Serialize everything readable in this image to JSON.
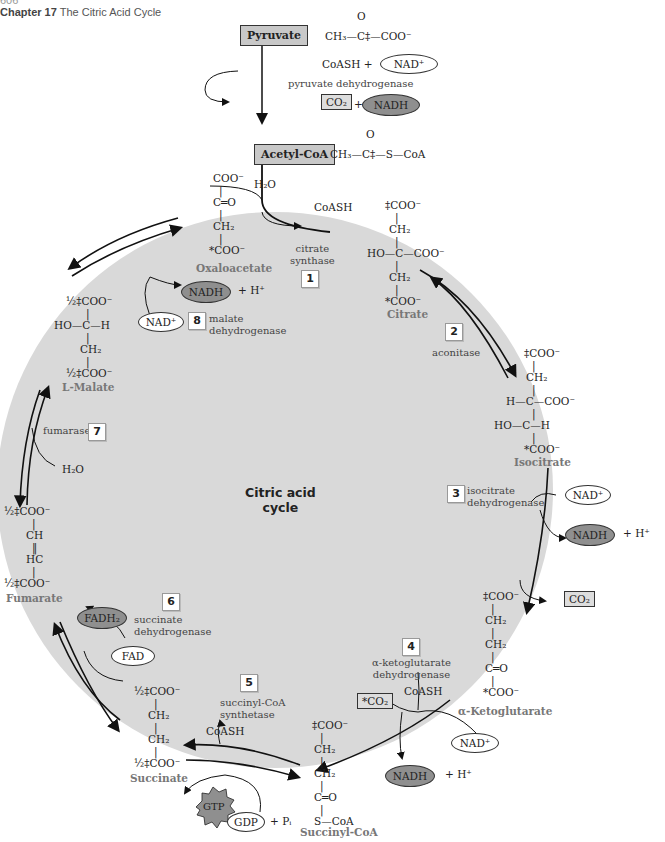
{
  "header": {
    "page_number": "606",
    "chapter": "Chapter 17",
    "title": "The Citric Acid Cycle"
  },
  "cycle_title": [
    "Citric acid",
    "cycle"
  ],
  "colors": {
    "cycle_fill": "#d9d9d9",
    "nadh_fill": "#8f8f8f",
    "box_fill": "#c8c8c8"
  },
  "entry": {
    "pyruvate": {
      "label": "Pyruvate",
      "formula": "CH₃—C‡—COO⁻",
      "carbonyl": "O"
    },
    "cofactors_in": "CoASH +",
    "nad": "NAD⁺",
    "enzyme": "pyruvate dehydrogenase",
    "co2": "CO₂",
    "plus": "+",
    "nadh": "NADH",
    "acetyl_coa": {
      "label": "Acetyl-CoA",
      "formula": "CH₃—C‡—S—CoA",
      "carbonyl": "O"
    },
    "h2o": "H₂O",
    "coash_out": "CoASH"
  },
  "steps": [
    {
      "num": "1",
      "enzyme": [
        "citrate",
        "synthase"
      ]
    },
    {
      "num": "2",
      "enzyme": [
        "aconitase"
      ]
    },
    {
      "num": "3",
      "enzyme": [
        "isocitrate",
        "dehydrogenase"
      ]
    },
    {
      "num": "4",
      "enzyme": [
        "α-ketoglutarate",
        "dehydrogenase"
      ]
    },
    {
      "num": "5",
      "enzyme": [
        "succinyl-CoA",
        "synthetase"
      ]
    },
    {
      "num": "6",
      "enzyme": [
        "succinate",
        "dehydrogenase"
      ]
    },
    {
      "num": "7",
      "enzyme": [
        "fumarase"
      ]
    },
    {
      "num": "8",
      "enzyme": [
        "malate",
        "dehydrogenase"
      ]
    }
  ],
  "compounds": {
    "oxaloacetate": {
      "name": "Oxaloacetate",
      "lines": [
        "COO⁻",
        "C═O",
        "CH₂",
        "*COO⁻"
      ]
    },
    "citrate": {
      "name": "Citrate",
      "lines": [
        "‡COO⁻",
        "CH₂",
        "HO—C—COO⁻",
        "CH₂",
        "*COO⁻"
      ]
    },
    "isocitrate": {
      "name": "Isocitrate",
      "lines": [
        "‡COO⁻",
        "CH₂",
        "H—C—COO⁻",
        "HO—C—H",
        "*COO⁻"
      ]
    },
    "alpha_ketoglutarate": {
      "name": "α-Ketoglutarate",
      "lines": [
        "‡COO⁻",
        "CH₂",
        "CH₂",
        "C═O",
        "*COO⁻"
      ]
    },
    "succinyl_coa": {
      "name": "Succinyl-CoA",
      "lines": [
        "‡COO⁻",
        "CH₂",
        "CH₂",
        "C═O",
        "S—CoA"
      ]
    },
    "succinate": {
      "name": "Succinate",
      "lines": [
        "½‡COO⁻",
        "CH₂",
        "CH₂",
        "½‡COO⁻"
      ]
    },
    "fumarate": {
      "name": "Fumarate",
      "lines": [
        "½‡COO⁻",
        "CH",
        "HC",
        "½‡COO⁻"
      ]
    },
    "malate": {
      "name": "L-Malate",
      "lines": [
        "½‡COO⁻",
        "HO—C—H",
        "CH₂",
        "½‡COO⁻"
      ]
    }
  },
  "cofactors": {
    "nad_plus": "NAD⁺",
    "nadh": "NADH",
    "h_plus": "+ H⁺",
    "co2": "CO₂",
    "co2_star": "*CO₂",
    "coash": "CoASH",
    "fad": "FAD",
    "fadh2": "FADH₂",
    "gtp": "GTP",
    "gdp": "GDP",
    "pi": "+ Pᵢ",
    "h2o": "H₂O"
  }
}
